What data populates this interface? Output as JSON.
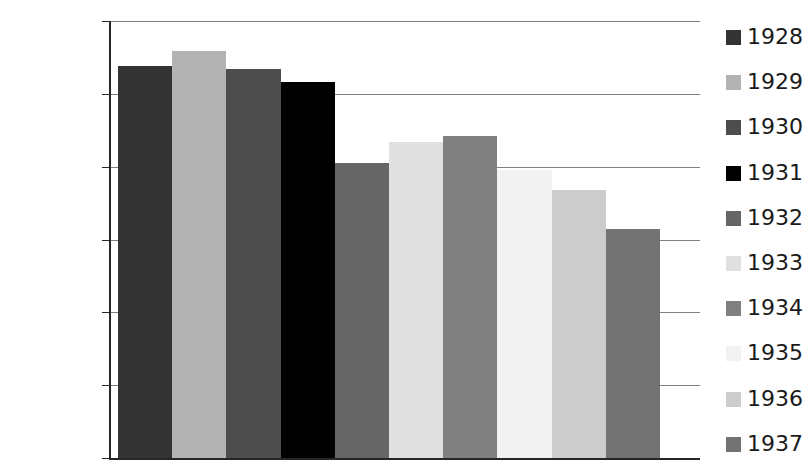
{
  "chart_data": {
    "type": "bar",
    "title": "",
    "subtitle": "",
    "xlabel": "",
    "ylabel": "",
    "categories": [
      "1928",
      "1929",
      "1930",
      "1931",
      "1932",
      "1933",
      "1934",
      "1935",
      "1936",
      "1937"
    ],
    "values": [
      5.38,
      5.59,
      5.34,
      5.16,
      4.05,
      4.34,
      4.42,
      3.95,
      3.68,
      3.14
    ],
    "colors": [
      "#333333",
      "#b3b3b3",
      "#4d4d4d",
      "#000000",
      "#666666",
      "#e0e0e0",
      "#808080",
      "#f2f2f2",
      "#cccccc",
      "#737373"
    ],
    "ylim": [
      0,
      6
    ],
    "ytick_labels": [
      "0",
      "1",
      "2",
      "3",
      "4",
      "5",
      "6"
    ],
    "ytick_values": [
      0,
      1,
      2,
      3,
      4,
      5,
      6
    ],
    "xtick_labels": [],
    "grid": true,
    "grid_color": "#808080",
    "axis_color": "#262626",
    "legend_position": "right",
    "legend_entries": [
      {
        "label": "1928",
        "color": "#333333"
      },
      {
        "label": "1929",
        "color": "#b3b3b3"
      },
      {
        "label": "1930",
        "color": "#4d4d4d"
      },
      {
        "label": "1931",
        "color": "#000000"
      },
      {
        "label": "1932",
        "color": "#666666"
      },
      {
        "label": "1933",
        "color": "#e0e0e0"
      },
      {
        "label": "1934",
        "color": "#808080"
      },
      {
        "label": "1935",
        "color": "#f2f2f2"
      },
      {
        "label": "1936",
        "color": "#cccccc"
      },
      {
        "label": "1937",
        "color": "#737373"
      }
    ]
  },
  "geometry": {
    "plot_left": 118,
    "plot_right": 660,
    "grid_right": 700,
    "baseline_y": 458,
    "top_y": 21,
    "axis_x": 110,
    "legend_first_top": 26,
    "legend_row_spacing": 45.2
  }
}
